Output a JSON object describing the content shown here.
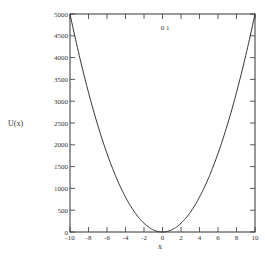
{
  "chart_data": {
    "type": "line",
    "title": "",
    "annotation": "0 1",
    "xlabel": "x",
    "ylabel": "U(x)",
    "xlim": [
      -10,
      10
    ],
    "ylim": [
      0,
      5000
    ],
    "grid": false,
    "legend": null,
    "x_ticks": [
      "-10",
      "-8",
      "-6",
      "-4",
      "-2",
      "0",
      "2",
      "4",
      "6",
      "8",
      "10"
    ],
    "y_ticks": [
      "0",
      "500",
      "1000",
      "1500",
      "2000",
      "2500",
      "3000",
      "3500",
      "4000",
      "4500",
      "5000"
    ],
    "series": [
      {
        "name": "U(x) = 50 x^2",
        "x": [
          -10,
          -9,
          -8,
          -7,
          -6,
          -5,
          -4,
          -3,
          -2,
          -1,
          0,
          1,
          2,
          3,
          4,
          5,
          6,
          7,
          8,
          9,
          10
        ],
        "values": [
          5000,
          4050,
          3200,
          2450,
          1800,
          1250,
          800,
          450,
          200,
          50,
          0,
          50,
          200,
          450,
          800,
          1250,
          1800,
          2450,
          3200,
          4050,
          5000
        ]
      }
    ]
  },
  "colors": {
    "line": "#333333",
    "axis": "#333333",
    "background": "#ffffff"
  }
}
